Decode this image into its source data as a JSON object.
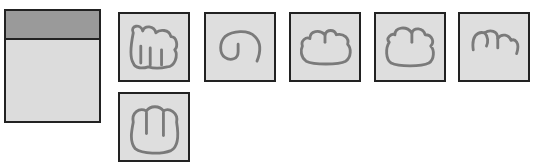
{
  "caption": "",
  "panel": {
    "name": "preview-panel"
  },
  "cards": [
    {
      "id": "card-1",
      "icon": "fist-side-icon"
    },
    {
      "id": "card-2",
      "icon": "spiral-hook-icon"
    },
    {
      "id": "card-3",
      "icon": "cloud-shape-icon"
    },
    {
      "id": "card-4",
      "icon": "cloud-shape-icon"
    },
    {
      "id": "card-5",
      "icon": "three-arches-icon"
    },
    {
      "id": "card-6",
      "icon": "fist-front-icon"
    }
  ],
  "colors": {
    "panel_header": "#9a9a9a",
    "panel_body": "#dcdcdc",
    "card_bg": "#dedede",
    "stroke": "#7a7a7a",
    "border": "#222222"
  }
}
